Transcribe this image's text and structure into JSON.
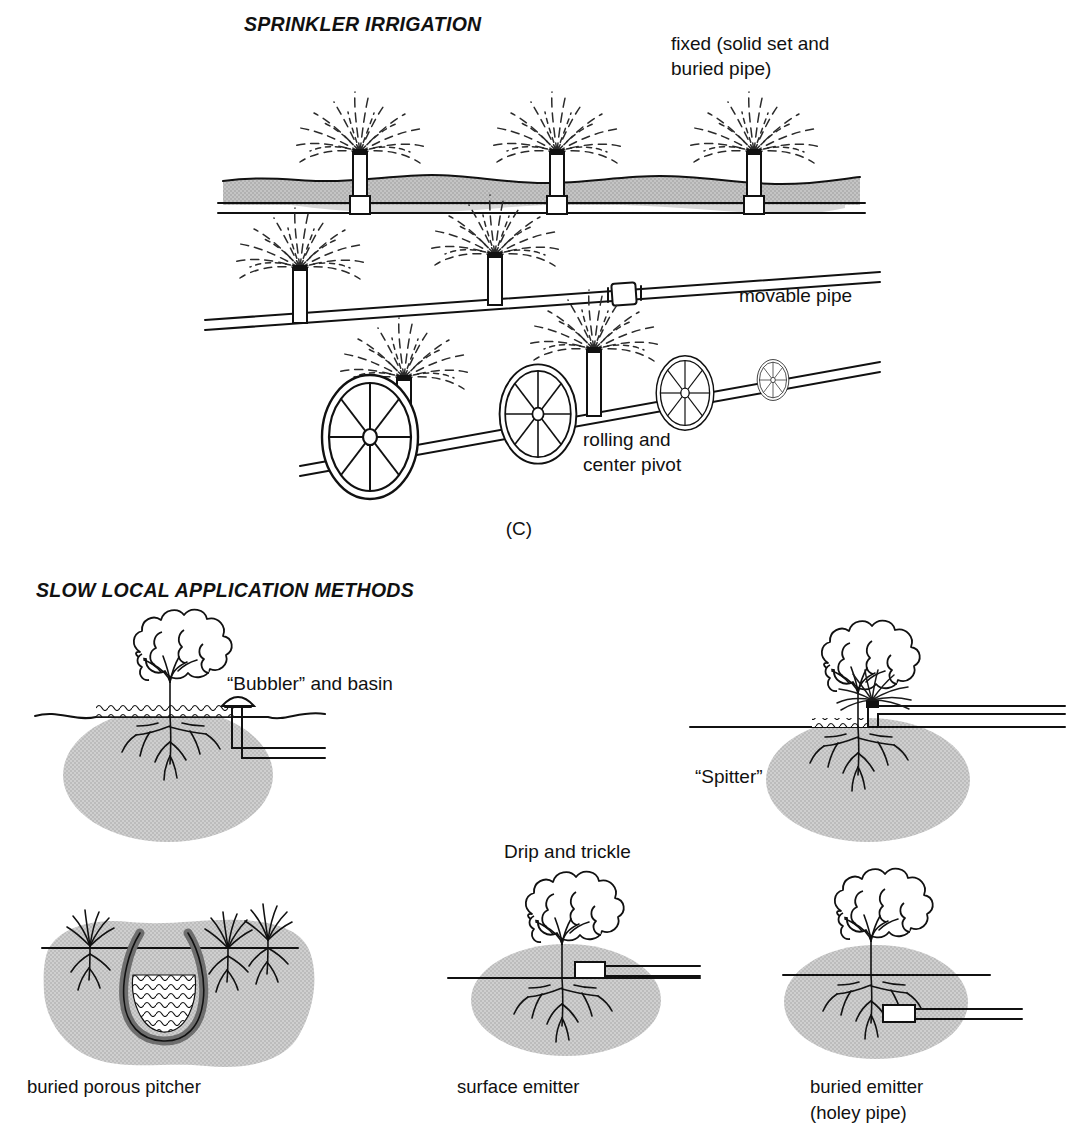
{
  "figure": {
    "panel_letter": "(C)",
    "sections": [
      {
        "id": "sprinkler",
        "title": "SPRINKLER IRRIGATION",
        "labels": {
          "fixed_line1": "fixed (solid set and",
          "fixed_line2": "buried pipe)",
          "movable": "movable pipe",
          "rolling_line1": "rolling and",
          "rolling_line2": "center pivot"
        }
      },
      {
        "id": "slow-local",
        "title": "SLOW LOCAL APPLICATION METHODS",
        "labels": {
          "bubbler": "“Bubbler” and basin",
          "spitter": "“Spitter”",
          "drip": "Drip and trickle"
        },
        "captions": [
          "buried porous pitcher",
          "surface emitter",
          "buried emitter",
          "(holey pipe)"
        ]
      }
    ],
    "colors": {
      "ink": "#111111",
      "soil_gray": "#c9c9c9",
      "wetted_gray": "#cccccc",
      "pitcher_gray": "#6e6e6e",
      "background": "#ffffff"
    }
  }
}
